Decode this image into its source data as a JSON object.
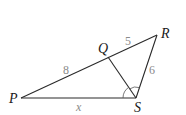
{
  "diagram": {
    "type": "triangle-geometry",
    "vertices": {
      "P": {
        "label": "P",
        "x": 21,
        "y": 98
      },
      "Q": {
        "label": "Q",
        "x": 108,
        "y": 57
      },
      "R": {
        "label": "R",
        "x": 157,
        "y": 35
      },
      "S": {
        "label": "S",
        "x": 136,
        "y": 98
      }
    },
    "segments": [
      {
        "from": "P",
        "to": "R"
      },
      {
        "from": "R",
        "to": "S"
      },
      {
        "from": "S",
        "to": "P"
      },
      {
        "from": "Q",
        "to": "S"
      }
    ],
    "side_labels": {
      "PQ": "8",
      "QR": "5",
      "RS": "6",
      "PS": "x"
    },
    "angle_marks": "angle PSQ and angle QSR marked equal (SQ bisects angle PSR)",
    "colors": {
      "line": "#2a2a2a",
      "vertex_label": "#1a1a1a",
      "measure_label": "#8a8a8a"
    }
  }
}
